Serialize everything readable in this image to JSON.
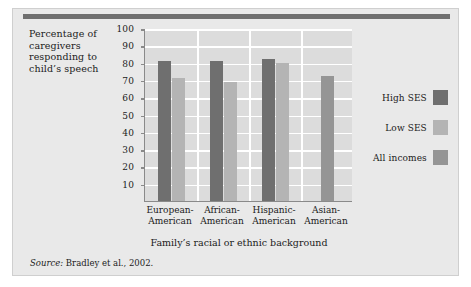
{
  "figure": {
    "y_axis_caption": "Percentage of caregivers responding to child’s speech",
    "x_axis_title": "Family’s racial or ethnic background",
    "source_prefix": "Source:",
    "source_text": " Bradley et al., 2002."
  },
  "legend": {
    "items": [
      {
        "label": "High SES",
        "color": "#6f6f6f"
      },
      {
        "label": "Low SES",
        "color": "#b4b4b4"
      },
      {
        "label": "All incomes",
        "color": "#959595"
      }
    ]
  },
  "chart_data": {
    "type": "bar",
    "title": "",
    "xlabel": "Family’s racial or ethnic background",
    "ylabel": "Percentage of caregivers responding to child’s speech",
    "ylim": [
      0,
      100
    ],
    "yticks": [
      10,
      20,
      30,
      40,
      50,
      60,
      70,
      80,
      90,
      100
    ],
    "ytick_labels": [
      "10",
      "20",
      "30",
      "40",
      "50",
      "60",
      "70",
      "80",
      "90",
      "100"
    ],
    "grid": "horizontal-and-vertical",
    "legend_position": "right",
    "categories": [
      "European-\nAmerican",
      "African-\nAmerican",
      "Hispanic-\nAmerican",
      "Asian-\nAmerican"
    ],
    "category_labels": [
      [
        "European-",
        "American"
      ],
      [
        "African-",
        "American"
      ],
      [
        "Hispanic-",
        "American"
      ],
      [
        "Asian-",
        "American"
      ]
    ],
    "series": [
      {
        "name": "High SES",
        "color": "#6f6f6f",
        "values": [
          81,
          81,
          82,
          null
        ]
      },
      {
        "name": "Low SES",
        "color": "#b4b4b4",
        "values": [
          71,
          69,
          80,
          null
        ]
      },
      {
        "name": "All incomes",
        "color": "#959595",
        "values": [
          null,
          null,
          null,
          72
        ]
      }
    ]
  }
}
